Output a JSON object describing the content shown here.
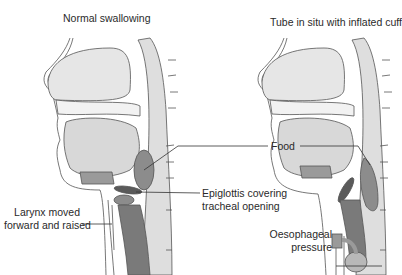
{
  "panels": [
    {
      "title": "Normal swallowing"
    },
    {
      "title": "Tube in situ with inflated cuff"
    }
  ],
  "labels": {
    "food": "Food",
    "epiglottis_line1": "Epiglottis covering",
    "epiglottis_line2": "tracheal opening",
    "larynx_line1": "Larynx moved",
    "larynx_line2": "forward and raised",
    "oesophageal_line1": "Oesophageal",
    "oesophageal_line2": "pressure"
  },
  "colors": {
    "background": "#ffffff",
    "outline": "#555555",
    "light_fill": "#e6e6e6",
    "mid_fill": "#c8c8c8",
    "dark_fill": "#8c8c8c",
    "darker_fill": "#6e6e6e",
    "epiglottis": "#5a5a5a"
  }
}
